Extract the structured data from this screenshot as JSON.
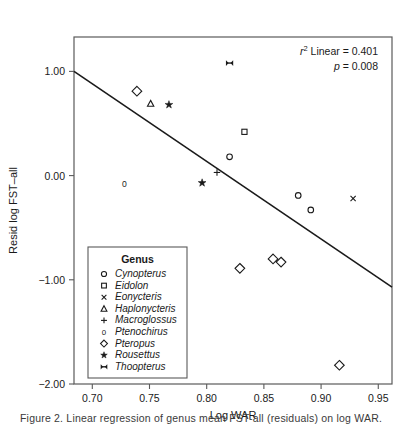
{
  "figure": {
    "caption": "Figure 2.  Linear regression of genus mean FST-all (residuals) on log WAR."
  },
  "chart_data": {
    "type": "scatter",
    "title": "",
    "xlabel": "Log WAR",
    "ylabel": "Resid log FST–all",
    "xlim": [
      0.684,
      0.962
    ],
    "ylim": [
      -2.0,
      1.33
    ],
    "xticks": [
      0.7,
      0.75,
      0.8,
      0.85,
      0.9,
      0.95
    ],
    "xticklabels": [
      "0.70",
      "0.75",
      "0.80",
      "0.85",
      "0.90",
      "0.95"
    ],
    "yticks": [
      1.0,
      0.0,
      -1.0,
      -2.0
    ],
    "yticklabels": [
      "1.00",
      "0.00",
      "−1.00",
      "−2.00"
    ],
    "grid": false,
    "annotations": [
      {
        "name": "r-squared",
        "text": "r² Linear = 0.401"
      },
      {
        "name": "p-value",
        "text": "p = 0.008"
      }
    ],
    "fit_line": {
      "name": "linear-fit",
      "x0": 0.684,
      "y0": 1.0,
      "x1": 0.962,
      "y1": -1.07,
      "color": "#1a1a1a"
    },
    "legend": {
      "title": "Genus",
      "position": "lower-left",
      "entries": [
        {
          "label": "Cynopterus",
          "marker": "circle"
        },
        {
          "label": "Eidolon",
          "marker": "square"
        },
        {
          "label": "Eonycteris",
          "marker": "cross-x"
        },
        {
          "label": "Haplonycteris",
          "marker": "triangle"
        },
        {
          "label": "Macroglossus",
          "marker": "plus"
        },
        {
          "label": "Ptenochirus",
          "marker": "zero"
        },
        {
          "label": "Pteropus",
          "marker": "diamond"
        },
        {
          "label": "Rousettus",
          "marker": "star"
        },
        {
          "label": "Thoopterus",
          "marker": "bowtie"
        }
      ]
    },
    "series": [
      {
        "name": "Cynopterus",
        "marker": "circle",
        "points": [
          [
            0.82,
            0.18
          ],
          [
            0.88,
            -0.19
          ],
          [
            0.891,
            -0.33
          ]
        ]
      },
      {
        "name": "Eidolon",
        "marker": "square",
        "points": [
          [
            0.833,
            0.42
          ]
        ]
      },
      {
        "name": "Eonycteris",
        "marker": "cross-x",
        "points": [
          [
            0.928,
            -0.22
          ]
        ]
      },
      {
        "name": "Haplonycteris",
        "marker": "triangle",
        "points": [
          [
            0.751,
            0.69
          ]
        ]
      },
      {
        "name": "Macroglossus",
        "marker": "plus",
        "points": [
          [
            0.809,
            0.03
          ]
        ]
      },
      {
        "name": "Ptenochirus",
        "marker": "zero",
        "points": [
          [
            0.728,
            -0.08
          ]
        ]
      },
      {
        "name": "Pteropus",
        "marker": "diamond",
        "points": [
          [
            0.739,
            0.81
          ],
          [
            0.829,
            -0.89
          ],
          [
            0.858,
            -0.8
          ],
          [
            0.865,
            -0.83
          ],
          [
            0.916,
            -1.82
          ]
        ]
      },
      {
        "name": "Rousettus",
        "marker": "star",
        "points": [
          [
            0.767,
            0.68
          ],
          [
            0.796,
            -0.07
          ]
        ]
      },
      {
        "name": "Thoopterus",
        "marker": "bowtie",
        "points": [
          [
            0.82,
            1.08
          ]
        ]
      }
    ]
  }
}
